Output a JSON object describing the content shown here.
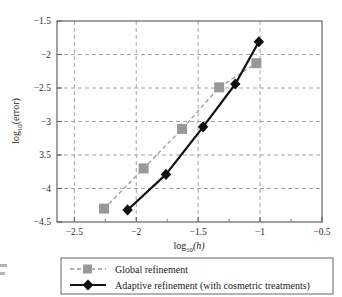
{
  "chart_data": {
    "type": "line",
    "title": "",
    "xlabel": "log10(h)",
    "ylabel": "log10(error)",
    "xlim": [
      -2.64,
      -0.5
    ],
    "ylim": [
      -4.5,
      -1.5
    ],
    "grid": true,
    "legend_position": "bottom",
    "xticks": [
      -2.5,
      -2,
      -1.5,
      -1,
      -0.5
    ],
    "xtick_labels": [
      "−2.5",
      "−2",
      "−1.5",
      "−1",
      "−0.5"
    ],
    "yticks": [
      -1.5,
      -2,
      -2.5,
      -3,
      -3.5,
      -4,
      -4.5
    ],
    "ytick_labels": [
      "−1.5",
      "−2",
      "−2.5",
      "−3",
      "3.5",
      "−4",
      "−4.5"
    ],
    "series": [
      {
        "name": "Global refinement",
        "color": "#999999",
        "marker": "square",
        "linestyle": "dashed",
        "x": [
          -2.26,
          -1.94,
          -1.63,
          -1.33,
          -1.03
        ],
        "y": [
          -4.3,
          -3.7,
          -3.11,
          -2.49,
          -2.13
        ]
      },
      {
        "name": "Adaptive refinement (with cosmetric treatments)",
        "color": "#111111",
        "marker": "diamond",
        "linestyle": "solid",
        "x": [
          -2.07,
          -1.76,
          -1.46,
          -1.2,
          -1.01
        ],
        "y": [
          -4.32,
          -3.79,
          -3.08,
          -2.44,
          -1.81
        ]
      }
    ]
  },
  "axis": {
    "xlabel_main": "log",
    "xlabel_sub": "10",
    "xlabel_arg": "(h)",
    "ylabel_main": "log",
    "ylabel_sub": "10",
    "ylabel_arg": "(error)"
  },
  "legend": {
    "items": [
      {
        "label": "Global refinement",
        "marker": "square-marker",
        "color": "#999999",
        "style": "dashed"
      },
      {
        "label": "Adaptive refinement (with cosmetric treatments)",
        "marker": "diamond-marker",
        "color": "#111111",
        "style": "solid"
      }
    ]
  }
}
